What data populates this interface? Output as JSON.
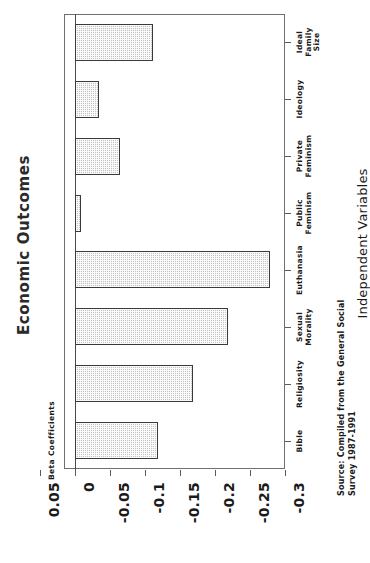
{
  "chart_data": {
    "type": "bar",
    "orientation": "horizontal",
    "title": "Economic Outcomes",
    "xlabel": "Independent Variables",
    "ylabel": "Beta Coefficients",
    "grid": false,
    "legend": null,
    "ylim": [
      0.05,
      -0.3
    ],
    "categories": [
      "Bible",
      "Religiosity",
      "Sexual\nMorality",
      "Euthanasia",
      "Public\nFeminism",
      "Private\nFeminism",
      "Ideology",
      "Ideal\nFamily\nSize"
    ],
    "values": [
      -0.119,
      -0.169,
      -0.219,
      -0.279,
      -0.009,
      -0.064,
      -0.034,
      -0.112
    ],
    "tick_labels": [
      "0.05",
      "0",
      "-0.05",
      "-0.1",
      "-0.15",
      "-0.2",
      "-0.25",
      "-0.3"
    ],
    "tick_values": [
      0.05,
      0,
      -0.05,
      -0.1,
      -0.15,
      -0.2,
      -0.25,
      -0.3
    ],
    "source": "Source: Compiled from the General Social\nSurvey 1987-1991",
    "bar_fill": "#c3c3c3",
    "bar_edge": "#3a3a3a",
    "axis_color": "#6f6f6f"
  }
}
